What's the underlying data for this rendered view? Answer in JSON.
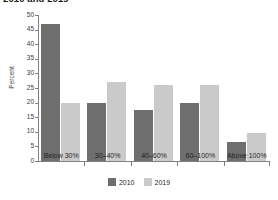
{
  "chart_data": {
    "type": "bar",
    "title": "2010 and 2019",
    "xlabel": "",
    "ylabel": "Percent",
    "ylim": [
      0,
      50
    ],
    "yticks": [
      0,
      5,
      10,
      15,
      20,
      25,
      30,
      35,
      40,
      45,
      50
    ],
    "grid": false,
    "legend_position": "bottom-center",
    "categories": [
      "Below 30%",
      "30–40%",
      "40–60%",
      "60–100%",
      "Above 100%"
    ],
    "series": [
      {
        "name": "2010",
        "color": "#6e6e6e",
        "values": [
          47,
          20,
          17.5,
          20,
          6.5
        ]
      },
      {
        "name": "2019",
        "color": "#cacaca",
        "values": [
          20,
          27,
          26,
          26,
          9.5
        ]
      }
    ]
  },
  "colors": {
    "series_2010": "#6e6e6e",
    "series_2019": "#cacaca",
    "axis": "#808080",
    "text": "#1f1f1f",
    "background": "#ffffff"
  }
}
